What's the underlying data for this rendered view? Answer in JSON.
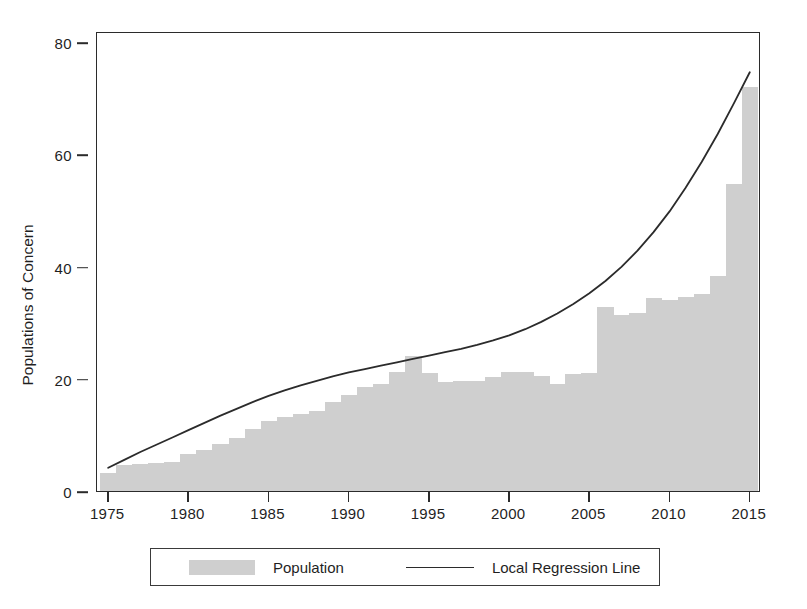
{
  "chart_data": {
    "type": "bar",
    "title": "",
    "subtitle": "",
    "xlabel": "",
    "ylabel": "Populations of Concern",
    "xlim": [
      1974.3,
      2015.7
    ],
    "ylim": [
      0,
      82
    ],
    "grid": false,
    "legend_position": "bottom",
    "x_ticks": [
      1975,
      1980,
      1985,
      1990,
      1995,
      2000,
      2005,
      2010,
      2015
    ],
    "y_ticks": [
      0,
      20,
      40,
      60,
      80
    ],
    "categories": [
      1975,
      1976,
      1977,
      1978,
      1979,
      1980,
      1981,
      1982,
      1983,
      1984,
      1985,
      1986,
      1987,
      1988,
      1989,
      1990,
      1991,
      1992,
      1993,
      1994,
      1995,
      1996,
      1997,
      1998,
      1999,
      2000,
      2001,
      2002,
      2003,
      2004,
      2005,
      2006,
      2007,
      2008,
      2009,
      2010,
      2011,
      2012,
      2013,
      2014,
      2015
    ],
    "series": [
      {
        "name": "Population",
        "type": "bar",
        "color": "#cfcfcf",
        "values": [
          3.2,
          4.6,
          4.8,
          5.0,
          5.2,
          6.6,
          7.4,
          8.3,
          9.5,
          11.0,
          12.5,
          13.2,
          13.8,
          14.3,
          15.8,
          17.2,
          18.6,
          19.0,
          21.2,
          24.0,
          21.0,
          19.4,
          19.6,
          19.7,
          20.3,
          21.2,
          21.3,
          20.5,
          19.0,
          20.8,
          21.0,
          32.8,
          31.4,
          31.7,
          34.4,
          34.0,
          34.5,
          35.2,
          38.4,
          54.8,
          72.0
        ]
      },
      {
        "name": "Local Regression Line",
        "type": "line",
        "color": "#2b2b2b",
        "values": [
          4.5,
          5.9,
          7.3,
          8.6,
          9.9,
          11.2,
          12.5,
          13.8,
          15.0,
          16.2,
          17.3,
          18.3,
          19.2,
          20.0,
          20.8,
          21.5,
          22.1,
          22.7,
          23.3,
          23.9,
          24.5,
          25.1,
          25.7,
          26.4,
          27.2,
          28.1,
          29.2,
          30.5,
          32.0,
          33.7,
          35.6,
          37.8,
          40.3,
          43.2,
          46.5,
          50.2,
          54.4,
          59.0,
          64.0,
          69.4,
          75.0
        ]
      }
    ],
    "legend": [
      {
        "label": "Population",
        "marker": "swatch",
        "color": "#cfcfcf"
      },
      {
        "label": "Local Regression Line",
        "marker": "line",
        "color": "#2b2b2b"
      }
    ]
  },
  "axes": {
    "y_title": "Populations of Concern",
    "y_tick_labels": [
      "0",
      "20",
      "40",
      "60",
      "80"
    ],
    "x_tick_labels": [
      "1975",
      "1980",
      "1985",
      "1990",
      "1995",
      "2000",
      "2005",
      "2010",
      "2015"
    ]
  },
  "legend": {
    "population_label": "Population",
    "regression_label": "Local Regression Line"
  }
}
